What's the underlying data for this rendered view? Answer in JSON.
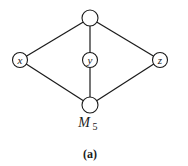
{
  "diagram": {
    "type": "lattice-hasse-diagram",
    "name": "M",
    "name_subscript": "5",
    "caption": "(a)",
    "colors": {
      "stroke": "#1a1a1a",
      "background": "#ffffff",
      "node_fill": "#ffffff"
    },
    "nodes": [
      {
        "id": "top",
        "label": "",
        "x": 90,
        "y": 18,
        "r": 8
      },
      {
        "id": "x",
        "label": "x",
        "x": 20,
        "y": 60,
        "r": 7.5
      },
      {
        "id": "y",
        "label": "y",
        "x": 90,
        "y": 60,
        "r": 7.5
      },
      {
        "id": "z",
        "label": "z",
        "x": 160,
        "y": 60,
        "r": 7.5
      },
      {
        "id": "bottom",
        "label": "",
        "x": 90,
        "y": 105,
        "r": 8
      }
    ],
    "edges": [
      {
        "from": "top",
        "to": "x"
      },
      {
        "from": "top",
        "to": "y"
      },
      {
        "from": "top",
        "to": "z"
      },
      {
        "from": "x",
        "to": "bottom"
      },
      {
        "from": "y",
        "to": "bottom"
      },
      {
        "from": "z",
        "to": "bottom"
      }
    ]
  }
}
